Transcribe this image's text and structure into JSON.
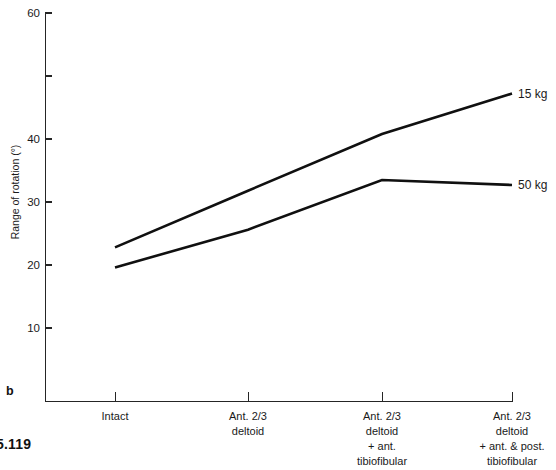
{
  "panel": {
    "letter": "b",
    "figure_number": "5.119"
  },
  "chart_data": {
    "type": "line",
    "title": "",
    "xlabel": "",
    "ylabel": "Range of rotation (°)",
    "categories": [
      "Intact",
      "Ant. 2/3\ndeltoid",
      "Ant. 2/3\ndeltoid\n+ ant.\ntibiofibular",
      "Ant. 2/3\ndeltoid\n+ ant. & post.\ntibiofibular"
    ],
    "category_lines": [
      [
        "Intact"
      ],
      [
        "Ant. 2/3",
        "deltoid"
      ],
      [
        "Ant. 2/3",
        "deltoid",
        "+ ant.",
        "tibiofibular"
      ],
      [
        "Ant. 2/3",
        "deltoid",
        "+ ant. & post.",
        "tibiofibular"
      ]
    ],
    "series": [
      {
        "name": "15 kg",
        "label": "15 kg",
        "values": [
          22.8,
          31.8,
          40.8,
          47.2
        ]
      },
      {
        "name": "50 kg",
        "label": "50 kg",
        "values": [
          19.6,
          25.6,
          33.5,
          32.7
        ]
      }
    ],
    "ylim": [
      0,
      60
    ],
    "yticks": [
      10,
      20,
      30,
      40,
      50,
      60
    ],
    "ytick_labels": [
      "10",
      "20",
      "30",
      "40",
      "",
      "60"
    ],
    "grid": false,
    "legend_position": "right-of-line-ends",
    "line_color": "#101010"
  }
}
